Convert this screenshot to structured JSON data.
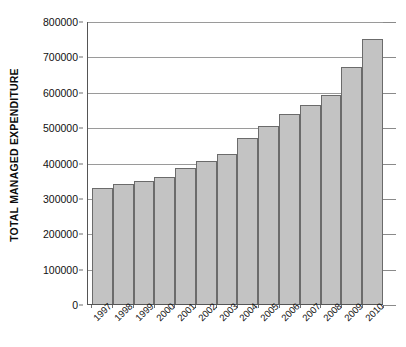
{
  "chart_data": {
    "type": "bar",
    "title": "",
    "xlabel": "",
    "ylabel": "TOTAL MANAGED EXPENDITURE",
    "categories": [
      "1997",
      "1998",
      "1999",
      "2000",
      "2001",
      "2002",
      "2003",
      "2004",
      "2005",
      "2006",
      "2007",
      "2008",
      "2009",
      "2010"
    ],
    "values": [
      328000,
      340000,
      348000,
      360000,
      385000,
      405000,
      425000,
      468000,
      502000,
      537000,
      562000,
      592000,
      670000,
      750000
    ],
    "series": [
      {
        "name": "Total managed expenditure",
        "values": [
          328000,
          340000,
          348000,
          360000,
          385000,
          405000,
          425000,
          468000,
          502000,
          537000,
          562000,
          592000,
          670000,
          750000
        ]
      }
    ],
    "ylim": [
      0,
      800000
    ],
    "y_ticks": [
      0,
      100000,
      200000,
      300000,
      400000,
      500000,
      600000,
      700000,
      800000
    ],
    "y_tick_labels": [
      "0",
      "100000",
      "200000",
      "300000",
      "400000",
      "500000",
      "600000",
      "700000",
      "800000"
    ],
    "grid": true,
    "grid_axis": "y",
    "legend": false,
    "legend_position": "none",
    "bar_color": "#c3c3c3",
    "bar_border_color": "#6b6b6b",
    "gridline_color": "#9a9a9a",
    "axis_color": "#555555",
    "background_color": "#ffffff",
    "text_color": "#111111"
  }
}
